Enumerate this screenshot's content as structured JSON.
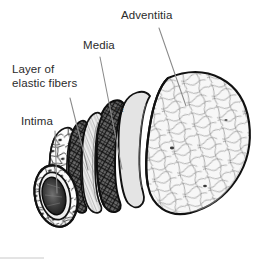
{
  "figure": {
    "width": 273,
    "height": 271,
    "background_color": "#ffffff",
    "ink_color": "#1a1a1a",
    "label_color": "#2b2b2b",
    "leader_line_color": "#8a8a8a",
    "style": "black and white pen-and-ink anatomical illustration",
    "view": "telescoping cutaway of a tubular vessel seen at an angle, layers peeled back in concentric steps from the cut end at lower left toward the intact tube at right"
  },
  "labels": [
    {
      "id": "adventitia",
      "text": "Adventitia",
      "x": 121,
      "y": 9,
      "lines": [
        "Adventitia"
      ],
      "leader": {
        "from_x": 159,
        "from_y": 28,
        "to_x": 186,
        "to_y": 106
      }
    },
    {
      "id": "media",
      "text": "Media",
      "x": 83,
      "y": 39,
      "lines": [
        "Media"
      ],
      "leader": {
        "from_x": 100,
        "from_y": 57,
        "to_x": 122,
        "to_y": 169
      }
    },
    {
      "id": "elastic",
      "text": "Layer of elastic fibers",
      "x": 12,
      "y": 63,
      "lines": [
        "Layer of",
        "elastic fibers"
      ],
      "leader": {
        "from_x": 70,
        "from_y": 98,
        "to_x": 88,
        "to_y": 170
      }
    },
    {
      "id": "intima",
      "text": "Intima",
      "x": 21,
      "y": 115,
      "lines": [
        "Intima"
      ],
      "leader": {
        "from_x": 55,
        "from_y": 131,
        "to_x": 57,
        "to_y": 193
      }
    }
  ],
  "layers": [
    {
      "id": "intima",
      "name": "Intima",
      "order": 1,
      "position": "innermost",
      "texture": "polygonal endothelial cells outlined in fine line, each with a small dark oval nucleus",
      "fill": "#fefefe"
    },
    {
      "id": "elastic",
      "name": "Layer of elastic fibers",
      "order": 2,
      "position": "between intima and media",
      "texture": "narrow smooth pale band with fine longitudinal striations",
      "fill": "#f2f2f2"
    },
    {
      "id": "media",
      "name": "Media",
      "order": 3,
      "position": "middle",
      "texture": "dense dark cross-hatched mesh of circumferential smooth muscle",
      "fill": "#4a4a4a"
    },
    {
      "id": "adventitia",
      "name": "Adventitia",
      "order": 4,
      "position": "outermost",
      "texture": "pale ground covered in loose wavy collagen fiber squiggles",
      "fill": "#f6f6f6"
    }
  ],
  "annotations": [
    {
      "id": "pe-mark",
      "text": "Pe",
      "x": 116,
      "y": 108,
      "note": "small inscription on the cut edge of the drawing"
    }
  ],
  "lumen": {
    "id": "lumen",
    "name": "Lumen",
    "note": "dark elliptical opening at the cut end of the vessel, lower left"
  }
}
